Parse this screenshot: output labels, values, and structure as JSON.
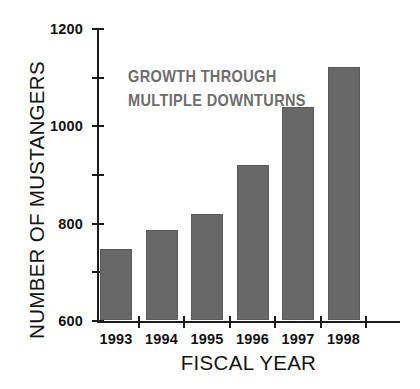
{
  "chart_data": {
    "type": "bar",
    "title": "",
    "subtitle": "",
    "xlabel": "FISCAL YEAR",
    "ylabel": "NUMBER OF MUSTANGERS",
    "categories": [
      "1993",
      "1994",
      "1995",
      "1996",
      "1997",
      "1998"
    ],
    "values": [
      290,
      370,
      435,
      635,
      875,
      1040
    ],
    "ylim": [
      0,
      1200
    ],
    "yticks": [
      0,
      200,
      400,
      600,
      800,
      1000,
      1200
    ],
    "ytick_labels": [
      "0",
      "200",
      "400",
      "600",
      "800",
      "1000",
      "1200"
    ],
    "grid": false,
    "legend": null,
    "annotations": [
      {
        "text_lines": [
          "GROWTH THROUGH",
          "MULTIPLE DOWNTURNS"
        ],
        "color": "#6d6d6d"
      }
    ],
    "bar_color": "#686868",
    "axis_color": "#1b1b1b",
    "background_color": "#ffffff"
  }
}
